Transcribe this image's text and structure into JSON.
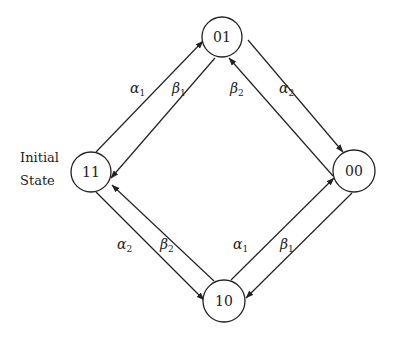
{
  "annotation": {
    "line1": "Initial",
    "line2": "State"
  },
  "states": [
    {
      "id": "01",
      "label": "01",
      "cx": 222,
      "cy": 37,
      "r": 20
    },
    {
      "id": "11",
      "label": "11",
      "cx": 91,
      "cy": 172,
      "r": 20
    },
    {
      "id": "00",
      "label": "00",
      "cx": 354,
      "cy": 171,
      "r": 21
    },
    {
      "id": "10",
      "label": "10",
      "cx": 224,
      "cy": 301,
      "r": 21
    }
  ],
  "edges": [
    {
      "from": "11",
      "to": "01",
      "symbol": "α",
      "sub": "1",
      "x1": 96,
      "y1": 152,
      "x2": 203,
      "y2": 41,
      "lx": 130,
      "ly": 93
    },
    {
      "from": "01",
      "to": "11",
      "symbol": "β",
      "sub": "1",
      "x1": 215,
      "y1": 58,
      "x2": 111,
      "y2": 178,
      "lx": 172,
      "ly": 93
    },
    {
      "from": "00",
      "to": "01",
      "symbol": "β",
      "sub": "2",
      "x1": 333,
      "y1": 176,
      "x2": 229,
      "y2": 58,
      "lx": 230,
      "ly": 93
    },
    {
      "from": "01",
      "to": "00",
      "symbol": "α",
      "sub": "2",
      "x1": 248,
      "y1": 40,
      "x2": 343,
      "y2": 152,
      "lx": 279,
      "ly": 93
    },
    {
      "from": "11",
      "to": "10",
      "symbol": "α",
      "sub": "2",
      "x1": 96,
      "y1": 192,
      "x2": 204,
      "y2": 300,
      "lx": 117,
      "ly": 249
    },
    {
      "from": "10",
      "to": "11",
      "symbol": "β",
      "sub": "2",
      "x1": 214,
      "y1": 281,
      "x2": 112,
      "y2": 185,
      "lx": 160,
      "ly": 249
    },
    {
      "from": "10",
      "to": "00",
      "symbol": "α",
      "sub": "1",
      "x1": 231,
      "y1": 280,
      "x2": 334,
      "y2": 178,
      "lx": 233,
      "ly": 249
    },
    {
      "from": "00",
      "to": "10",
      "symbol": "β",
      "sub": "1",
      "x1": 352,
      "y1": 193,
      "x2": 246,
      "y2": 298,
      "lx": 280,
      "ly": 249
    }
  ],
  "colors": {
    "stroke": "#222222",
    "background": "#ffffff"
  }
}
